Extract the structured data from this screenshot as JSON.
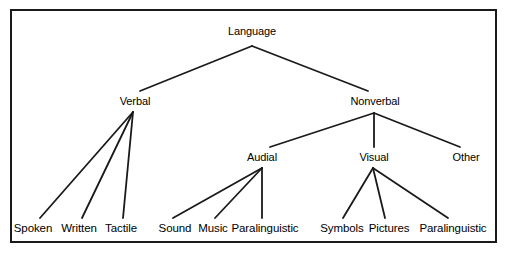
{
  "diagram": {
    "type": "tree",
    "background_color": "#ffffff",
    "line_color": "#1a1a1a",
    "text_color": "#000000",
    "border": {
      "color": "#1a1a1a",
      "width_px": 2,
      "x": 10,
      "y": 9,
      "width": 487,
      "height": 234
    },
    "nodes": [
      {
        "id": "language",
        "label": "Language",
        "level": 1,
        "x": 252,
        "y": 31
      },
      {
        "id": "verbal",
        "label": "Verbal",
        "level": 2,
        "x": 135,
        "y": 101
      },
      {
        "id": "nonverbal",
        "label": "Nonverbal",
        "level": 2,
        "x": 375,
        "y": 101
      },
      {
        "id": "audial",
        "label": "Audial",
        "level": 3,
        "x": 262,
        "y": 157
      },
      {
        "id": "visual",
        "label": "Visual",
        "level": 3,
        "x": 374,
        "y": 157
      },
      {
        "id": "other",
        "label": "Other",
        "level": 3,
        "x": 466,
        "y": 157
      },
      {
        "id": "spoken",
        "label": "Spoken",
        "level": 4,
        "x": 33,
        "y": 228
      },
      {
        "id": "written",
        "label": "Written",
        "level": 4,
        "x": 79,
        "y": 228
      },
      {
        "id": "tactile",
        "label": "Tactile",
        "level": 4,
        "x": 121,
        "y": 228
      },
      {
        "id": "sound",
        "label": "Sound",
        "level": 4,
        "x": 175,
        "y": 228
      },
      {
        "id": "music",
        "label": "Music",
        "level": 4,
        "x": 213,
        "y": 228
      },
      {
        "id": "para-audial",
        "label": "Paralinguistic",
        "level": 4,
        "x": 265,
        "y": 228
      },
      {
        "id": "symbols",
        "label": "Symbols",
        "level": 4,
        "x": 342,
        "y": 228
      },
      {
        "id": "pictures",
        "label": "Pictures",
        "level": 4,
        "x": 389,
        "y": 228
      },
      {
        "id": "para-visual",
        "label": "Paralinguistic",
        "level": 4,
        "x": 453,
        "y": 228
      }
    ],
    "edges": [
      {
        "from": "language",
        "to": "verbal",
        "x1": 252,
        "y1": 46,
        "x2": 140,
        "y2": 91
      },
      {
        "from": "language",
        "to": "nonverbal",
        "x1": 252,
        "y1": 46,
        "x2": 368,
        "y2": 91
      },
      {
        "from": "verbal",
        "to": "spoken",
        "x1": 133,
        "y1": 112,
        "x2": 40,
        "y2": 218
      },
      {
        "from": "verbal",
        "to": "written",
        "x1": 133,
        "y1": 112,
        "x2": 82,
        "y2": 218
      },
      {
        "from": "verbal",
        "to": "tactile",
        "x1": 133,
        "y1": 112,
        "x2": 123,
        "y2": 218
      },
      {
        "from": "nonverbal",
        "to": "audial",
        "x1": 374,
        "y1": 113,
        "x2": 270,
        "y2": 147
      },
      {
        "from": "nonverbal",
        "to": "visual",
        "x1": 374,
        "y1": 113,
        "x2": 374,
        "y2": 147
      },
      {
        "from": "nonverbal",
        "to": "other",
        "x1": 374,
        "y1": 113,
        "x2": 460,
        "y2": 147
      },
      {
        "from": "audial",
        "to": "sound",
        "x1": 262,
        "y1": 168,
        "x2": 173,
        "y2": 218
      },
      {
        "from": "audial",
        "to": "music",
        "x1": 262,
        "y1": 168,
        "x2": 215,
        "y2": 218
      },
      {
        "from": "audial",
        "to": "para-audial",
        "x1": 262,
        "y1": 168,
        "x2": 262,
        "y2": 218
      },
      {
        "from": "visual",
        "to": "symbols",
        "x1": 373,
        "y1": 168,
        "x2": 343,
        "y2": 218
      },
      {
        "from": "visual",
        "to": "pictures",
        "x1": 373,
        "y1": 168,
        "x2": 385,
        "y2": 218
      },
      {
        "from": "visual",
        "to": "para-visual",
        "x1": 373,
        "y1": 168,
        "x2": 448,
        "y2": 218
      }
    ]
  }
}
